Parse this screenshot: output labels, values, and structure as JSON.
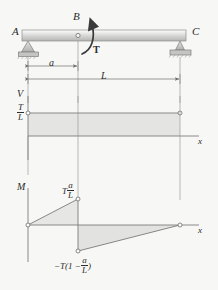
{
  "figure": {
    "kind": "beam-shear-moment-diagram"
  },
  "beam": {
    "support_left_label": "A",
    "point_load_label": "B",
    "support_right_label": "C",
    "torque_label": "T",
    "torque_direction": "counterclockwise"
  },
  "dimensions": {
    "a_label": "a",
    "L_label": "L"
  },
  "shear_diagram": {
    "axis_label": "V",
    "x_axis_label": "x",
    "value_numerator": "T",
    "value_denominator": "L",
    "value_text": "T/L",
    "shape": "constant positive from A to C"
  },
  "moment_diagram": {
    "axis_label": "M",
    "x_axis_label": "x",
    "peak_prefix": "T",
    "peak_numerator": "a",
    "peak_denominator": "L",
    "peak_text": "T a/L",
    "min_prefix": "−T(1 − ",
    "min_numerator": "a",
    "min_denominator": "L",
    "min_suffix": ")",
    "min_text": "-T(1 - a/L)",
    "shape": "linear rise to B, jump down at B, linear rise to zero at C"
  },
  "colors": {
    "line": "#6f6f6f",
    "dark_line": "#3a3a3a",
    "fill": "#e4e4e2",
    "beam_light": "#fdfdfd",
    "beam_dark": "#b9b9b7",
    "support": "#c9c9c7",
    "text": "#2b2b2b",
    "page": "#f7f7f5"
  }
}
